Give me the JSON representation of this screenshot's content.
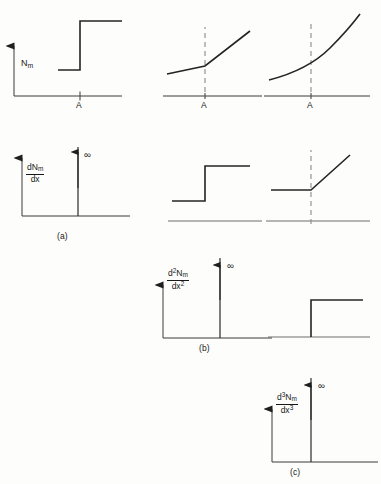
{
  "figure": {
    "background_color": "#fdfdfb",
    "line_color": "#242424",
    "axis_color": "#3a3a3a",
    "dashed_color": "#8a8a8a",
    "baseline_color": "#6e6e6e"
  },
  "labels": {
    "nm": "N",
    "nm_sub": "m",
    "d": "d",
    "dx": "dx",
    "n": "N",
    "m": "m",
    "two": "2",
    "three": "3",
    "point_a": "A",
    "infinity": "∞",
    "caption_a": "(a)",
    "caption_b": "(b)",
    "caption_c": "(c)"
  },
  "rows": [
    {
      "id": "row-a",
      "caption": "(a)",
      "y_axis_label": "Nm",
      "derivative_label": "dNm/dx",
      "panels": [
        {
          "id": "panel-a1",
          "column": "left",
          "kind": "step-discontinuity",
          "has_y_axis": true,
          "has_x_axis": true,
          "has_tick_a": true,
          "tick_label": "A",
          "description": "Nm jumps discontinuously upward at A"
        },
        {
          "id": "panel-a2",
          "column": "middle",
          "kind": "piecewise-linear-kink",
          "has_y_axis": false,
          "has_x_axis": true,
          "has_dashed_marker": true,
          "has_tick_a": true,
          "tick_label": "A",
          "description": "Shallow line steepens abruptly at A"
        },
        {
          "id": "panel-a3",
          "column": "right",
          "kind": "smooth-curve",
          "has_y_axis": false,
          "has_x_axis": true,
          "has_dashed_marker": true,
          "has_tick_a": true,
          "tick_label": "A",
          "description": "Smooth convex curve through A"
        }
      ]
    },
    {
      "id": "row-b",
      "caption": "(b)",
      "derivative_label": "d2Nm/dx2",
      "panels": [
        {
          "id": "panel-b1",
          "column": "left",
          "kind": "delta-spike",
          "has_y_axis": true,
          "has_x_axis": true,
          "spike_label": "∞",
          "axis_label": "dNm/dx",
          "caption": "(a)",
          "description": "First derivative is a delta function of infinite height"
        },
        {
          "id": "panel-b2",
          "column": "middle",
          "kind": "step-function",
          "has_y_axis": false,
          "has_x_axis": false,
          "has_baseline": true,
          "description": "First derivative is a finite step"
        },
        {
          "id": "panel-b3",
          "column": "right",
          "kind": "ramp-from-flat",
          "has_y_axis": false,
          "has_x_axis": false,
          "has_baseline": true,
          "has_dashed_marker": true,
          "description": "First derivative is flat then rises linearly"
        }
      ]
    },
    {
      "id": "row-c",
      "caption": "(c)",
      "derivative_label": "d3Nm/dx3",
      "panels": [
        {
          "id": "panel-c1",
          "column": "middle",
          "kind": "delta-spike",
          "has_y_axis": true,
          "has_x_axis": true,
          "spike_label": "∞",
          "axis_label": "d2Nm/dx2",
          "caption": "(b)",
          "description": "Second derivative is a delta function of infinite height"
        },
        {
          "id": "panel-c2",
          "column": "right",
          "kind": "step-function",
          "has_y_axis": false,
          "has_x_axis": false,
          "has_baseline": true,
          "description": "Second derivative is a finite step"
        }
      ]
    },
    {
      "id": "row-d",
      "caption": "(c)",
      "panels": [
        {
          "id": "panel-d1",
          "column": "right",
          "kind": "delta-spike",
          "has_y_axis": true,
          "has_x_axis": true,
          "spike_label": "∞",
          "axis_label": "d3Nm/dx3",
          "caption": "(c)",
          "description": "Third derivative is a delta function of infinite height"
        }
      ]
    }
  ]
}
